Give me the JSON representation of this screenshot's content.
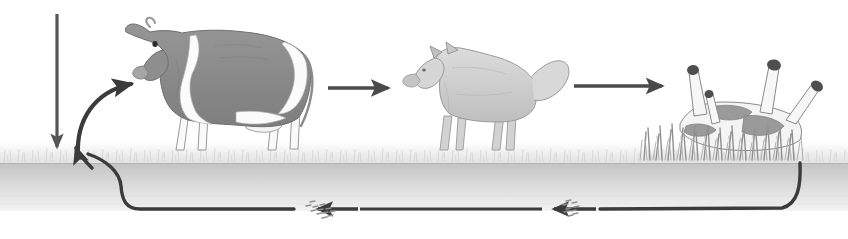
{
  "diagram": {
    "background_color": "#ffffff",
    "ground": {
      "grass_band_label": "grass-layer",
      "grass_color_light": "#f2f2f2",
      "grass_color_mid": "#dcdcdc",
      "soil_label": "soil-layer",
      "soil_color_top": "#c9c9c9",
      "soil_color_bottom": "#efefef"
    },
    "nodes": [
      {
        "id": "sunlight-arrow",
        "label": "sunlight-energy-input",
        "type": "arrow-straight-down",
        "color": "#555555"
      },
      {
        "id": "grass-to-cow",
        "label": "grass-eaten-by-cow",
        "type": "arrow-curved",
        "color": "#3b3b3b"
      },
      {
        "id": "cow",
        "label": "cow-herbivore",
        "type": "animal",
        "body_color": "#8c8c8c",
        "patch_color": "#f7f7f7",
        "outline_color": "#6e6e6e"
      },
      {
        "id": "cow-to-wolf",
        "label": "cow-eaten-by-wolf",
        "type": "arrow-straight-right",
        "color": "#4a4a4a"
      },
      {
        "id": "wolf",
        "label": "wolf-carnivore",
        "type": "animal",
        "body_color": "#cfcfcf",
        "outline_color": "#9a9a9a"
      },
      {
        "id": "wolf-to-carcass",
        "label": "wolf-to-dead-animal",
        "type": "arrow-straight-right",
        "color": "#4a4a4a"
      },
      {
        "id": "carcass",
        "label": "dead-cow-carcass",
        "type": "animal",
        "body_color": "#f2f2f2",
        "outline_color": "#8a8a8a",
        "hoof_color": "#4f4f4f",
        "tall_grass_color": "#8f8f8f"
      },
      {
        "id": "carcass-to-decomposers",
        "label": "carcass-return-to-soil",
        "type": "arrow-curved-return",
        "color": "#3b3b3b"
      },
      {
        "id": "decomposers-right",
        "label": "decomposer-particles-right",
        "type": "particles",
        "color": "#9a9a9a"
      },
      {
        "id": "decomposers-left",
        "label": "decomposer-particles-left",
        "type": "particles",
        "color": "#9a9a9a"
      },
      {
        "id": "nutrients-to-grass",
        "label": "nutrients-returned-to-grass",
        "type": "arrow-curved-up",
        "color": "#3b3b3b"
      }
    ]
  }
}
